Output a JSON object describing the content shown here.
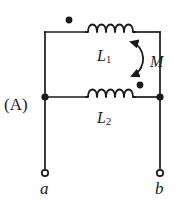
{
  "figure": {
    "kind": "circuit-diagram",
    "option_label": "(A)",
    "background_color": "#ffffff",
    "wire_color": "#1a1a1a"
  },
  "labels": {
    "inductor_top_base": "L",
    "inductor_top_sub": "1",
    "inductor_bottom_base": "L",
    "inductor_bottom_sub": "2",
    "mutual_inductance": "M",
    "terminal_left": "a",
    "terminal_right": "b"
  },
  "components": [
    {
      "name": "inductor-L1",
      "type": "inductor",
      "label": "L1",
      "coils": 5,
      "dot_marking": "left",
      "branch": "top"
    },
    {
      "name": "inductor-L2",
      "type": "inductor",
      "label": "L2",
      "coils": 5,
      "dot_marking": "right",
      "branch": "middle"
    },
    {
      "name": "mutual-coupling",
      "type": "coupling-arrow",
      "label": "M",
      "style": "double-headed-curve"
    }
  ],
  "terminals": [
    {
      "name": "terminal-a",
      "label": "a",
      "style": "open-circle"
    },
    {
      "name": "terminal-b",
      "label": "b",
      "style": "open-circle"
    }
  ],
  "junctions": [
    {
      "name": "junction-left",
      "style": "filled-dot"
    },
    {
      "name": "junction-right",
      "style": "filled-dot"
    }
  ],
  "polarity_dots": [
    {
      "name": "dot-L1-left",
      "for": "L1",
      "side": "left"
    },
    {
      "name": "dot-L2-right",
      "for": "L2",
      "side": "right"
    }
  ]
}
